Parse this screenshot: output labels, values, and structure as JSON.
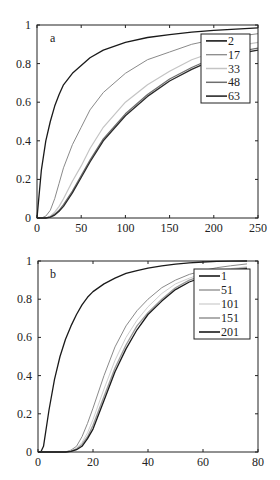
{
  "chart_data": [
    {
      "type": "line",
      "panel_label": "a",
      "title": "",
      "xlabel": "",
      "ylabel": "",
      "xlim": [
        0,
        250
      ],
      "ylim": [
        0,
        1
      ],
      "xticks": [
        0,
        50,
        100,
        150,
        200,
        250
      ],
      "yticks": [
        0,
        0.2,
        0.4,
        0.6,
        0.8,
        1
      ],
      "ytick_labels": [
        "0",
        "0.2",
        "0.4",
        "0.6",
        "0.8",
        "1"
      ],
      "grid": false,
      "legend_position": "upper right",
      "x": [
        0,
        5,
        10,
        15,
        20,
        25,
        30,
        40,
        50,
        60,
        75,
        100,
        125,
        150,
        175,
        200,
        225,
        250
      ],
      "series": [
        {
          "name": "2",
          "color": "#1a1a1a",
          "width": 1.3,
          "values": [
            0,
            0.25,
            0.4,
            0.5,
            0.58,
            0.64,
            0.69,
            0.75,
            0.79,
            0.83,
            0.87,
            0.91,
            0.935,
            0.95,
            0.963,
            0.972,
            0.979,
            0.985
          ]
        },
        {
          "name": "17",
          "color": "#8a8a8a",
          "width": 1.0,
          "values": [
            0,
            0,
            0.01,
            0.04,
            0.1,
            0.18,
            0.26,
            0.38,
            0.47,
            0.56,
            0.65,
            0.75,
            0.82,
            0.86,
            0.9,
            0.925,
            0.94,
            0.955
          ]
        },
        {
          "name": "33",
          "color": "#c4c4c4",
          "width": 1.2,
          "values": [
            0,
            0,
            0,
            0.01,
            0.03,
            0.06,
            0.1,
            0.19,
            0.27,
            0.36,
            0.47,
            0.6,
            0.69,
            0.76,
            0.82,
            0.86,
            0.89,
            0.91
          ]
        },
        {
          "name": "48",
          "color": "#6e6e6e",
          "width": 1.2,
          "values": [
            0,
            0,
            0,
            0.005,
            0.02,
            0.04,
            0.07,
            0.14,
            0.22,
            0.3,
            0.41,
            0.54,
            0.64,
            0.72,
            0.78,
            0.83,
            0.86,
            0.88
          ]
        },
        {
          "name": "63",
          "color": "#2a2a2a",
          "width": 1.3,
          "values": [
            0,
            0,
            0,
            0.004,
            0.015,
            0.035,
            0.06,
            0.13,
            0.21,
            0.29,
            0.4,
            0.53,
            0.63,
            0.71,
            0.77,
            0.82,
            0.85,
            0.87
          ]
        }
      ]
    },
    {
      "type": "line",
      "panel_label": "b",
      "title": "",
      "xlabel": "",
      "ylabel": "",
      "xlim": [
        0,
        80
      ],
      "ylim": [
        0,
        1
      ],
      "xticks": [
        0,
        20,
        40,
        60,
        80
      ],
      "yticks": [
        0,
        0.2,
        0.4,
        0.6,
        0.8,
        1
      ],
      "ytick_labels": [
        "0",
        "0.2",
        "0.4",
        "0.6",
        "0.8",
        "1"
      ],
      "grid": false,
      "legend_position": "upper right",
      "x": [
        0,
        1,
        2,
        4,
        6,
        8,
        10,
        12,
        14,
        16,
        18,
        20,
        24,
        28,
        32,
        36,
        40,
        45,
        50,
        55,
        60,
        65,
        70,
        76
      ],
      "series": [
        {
          "name": "1",
          "color": "#1a1a1a",
          "width": 1.3,
          "values": [
            0,
            0,
            0.03,
            0.22,
            0.38,
            0.5,
            0.59,
            0.66,
            0.72,
            0.77,
            0.81,
            0.84,
            0.88,
            0.91,
            0.935,
            0.95,
            0.963,
            0.975,
            0.983,
            0.99,
            0.995,
            0.998,
            0.999,
            1.0
          ]
        },
        {
          "name": "51",
          "color": "#8a8a8a",
          "width": 1.0,
          "values": [
            0,
            0,
            0,
            0,
            0,
            0,
            0,
            0.01,
            0.03,
            0.08,
            0.15,
            0.23,
            0.4,
            0.55,
            0.66,
            0.74,
            0.8,
            0.86,
            0.9,
            0.93,
            0.95,
            0.965,
            0.975,
            0.985
          ]
        },
        {
          "name": "101",
          "color": "#cfcfcf",
          "width": 1.0,
          "values": [
            0,
            0,
            0,
            0,
            0,
            0,
            0,
            0.005,
            0.02,
            0.05,
            0.1,
            0.17,
            0.33,
            0.48,
            0.6,
            0.69,
            0.76,
            0.83,
            0.88,
            0.91,
            0.935,
            0.95,
            0.96,
            0.97
          ]
        },
        {
          "name": "151",
          "color": "#9a9a9a",
          "width": 1.3,
          "values": [
            0,
            0,
            0,
            0,
            0,
            0,
            0,
            0.004,
            0.015,
            0.04,
            0.08,
            0.14,
            0.29,
            0.44,
            0.56,
            0.66,
            0.73,
            0.8,
            0.86,
            0.9,
            0.925,
            0.94,
            0.955,
            0.965
          ]
        },
        {
          "name": "201",
          "color": "#1a1a1a",
          "width": 1.3,
          "values": [
            0,
            0,
            0,
            0,
            0,
            0,
            0,
            0.003,
            0.012,
            0.03,
            0.07,
            0.12,
            0.27,
            0.42,
            0.54,
            0.64,
            0.72,
            0.79,
            0.85,
            0.89,
            0.915,
            0.935,
            0.95,
            0.96
          ]
        }
      ]
    }
  ]
}
